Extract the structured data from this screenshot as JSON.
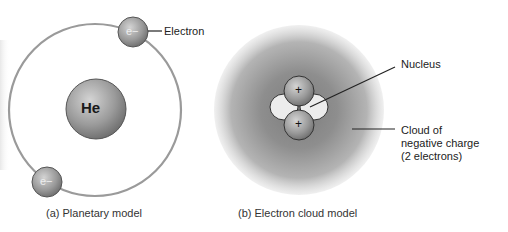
{
  "panels": {
    "planetary": {
      "caption": "(a) Planetary model",
      "nucleus_label": "He",
      "electron_symbol": "e−",
      "electron_label": "Electron"
    },
    "cloud": {
      "caption": "(b) Electron cloud model",
      "proton_symbol": "+",
      "nucleus_label": "Nucleus",
      "cloud_label_lines": [
        "Cloud of",
        "negative charge",
        "(2 electrons)"
      ]
    }
  },
  "colors": {
    "orbit": "#9a9a9a",
    "sphere_light": "#d0d0d0",
    "sphere_dark": "#6e6e6e",
    "cloud_center": "#7a7a7a",
    "neutron": "#ededed",
    "text": "#222222"
  }
}
